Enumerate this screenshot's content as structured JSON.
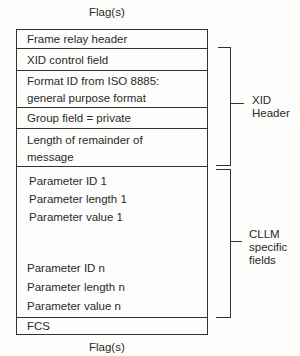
{
  "diagram": {
    "top_flag": "Flag(s)",
    "bottom_flag": "Flag(s)",
    "rows": [
      {
        "lines": [
          "Frame relay header"
        ]
      },
      {
        "lines": [
          "XID control field"
        ]
      },
      {
        "lines": [
          "Format ID from ISO 8885:",
          "general purpose format"
        ]
      },
      {
        "lines": [
          "Group field = private"
        ]
      },
      {
        "lines": [
          "Length of remainder of",
          "message"
        ]
      }
    ],
    "parameters": {
      "first": [
        "Parameter ID 1",
        "Parameter length 1",
        "Parameter value 1"
      ],
      "last": [
        "Parameter ID n",
        "Parameter length n",
        "Parameter value n"
      ]
    },
    "fcs": "FCS",
    "brackets": {
      "xid_header": [
        "XID",
        "Header"
      ],
      "cllm_fields": [
        "CLLM",
        "specific",
        "fields"
      ]
    }
  }
}
